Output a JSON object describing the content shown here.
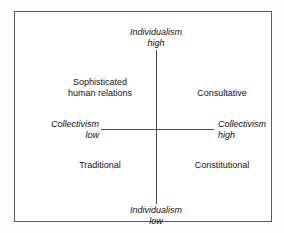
{
  "diagram": {
    "type": "2x2-matrix",
    "axes": {
      "vertical": {
        "name": "Individualism",
        "high_label": {
          "line1": "Individualism",
          "line2": "high"
        },
        "low_label": {
          "line1": "Individualism",
          "line2": "low"
        }
      },
      "horizontal": {
        "name": "Collectivism",
        "low_label": {
          "line1": "Collectivism",
          "line2": "low"
        },
        "high_label": {
          "line1": "Collectivism",
          "line2": "high"
        }
      }
    },
    "quadrants": [
      {
        "position": "top-left",
        "line1": "Sophisticated",
        "line2": "human relations",
        "meaning": "Individualism high / Collectivism low"
      },
      {
        "position": "top-right",
        "line1": "Consultative",
        "line2": "",
        "meaning": "Individualism high / Collectivism high"
      },
      {
        "position": "bottom-left",
        "line1": "Traditional",
        "line2": "",
        "meaning": "Individualism low / Collectivism low"
      },
      {
        "position": "bottom-right",
        "line1": "Constitutional",
        "line2": "",
        "meaning": "Individualism low / Collectivism high"
      }
    ],
    "colors": {
      "background": "#ffffff",
      "frame_border": "#5a5a5a",
      "axis_line": "#4a4a4a",
      "text": "#111111"
    }
  }
}
